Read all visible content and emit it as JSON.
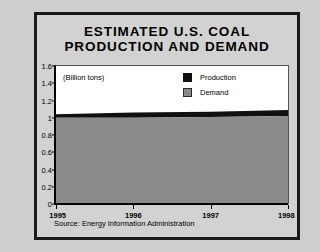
{
  "title": {
    "line1": "ESTIMATED U.S. COAL",
    "line2": "PRODUCTION AND DEMAND"
  },
  "units_note": "(Billion tons)",
  "legend": {
    "items": [
      {
        "label": "Production",
        "color": "#101010",
        "swatch": "production-swatch"
      },
      {
        "label": "Demand",
        "color": "#8a8a8a",
        "swatch": "demand-swatch"
      }
    ]
  },
  "source": "Source: Energy Information Administration",
  "chart_data": {
    "type": "area",
    "title": "ESTIMATED U.S. COAL PRODUCTION AND DEMAND",
    "xlabel": "",
    "ylabel": "",
    "units": "Billion tons",
    "stacked": false,
    "grid": false,
    "legend_position": "top-right",
    "x": [
      1995,
      1996,
      1997,
      1998
    ],
    "xtick_labels": [
      "1995",
      "1996",
      "1997",
      "1998"
    ],
    "xlim": [
      1995,
      1998
    ],
    "ylim": [
      0,
      1.6
    ],
    "ytick_labels": [
      "0",
      "0.2",
      "0.4",
      "0.6",
      "0.8",
      "1",
      "1.2",
      "1.4",
      "1.6"
    ],
    "ytick_values": [
      0,
      0.2,
      0.4,
      0.6,
      0.8,
      1.0,
      1.2,
      1.4,
      1.6
    ],
    "series": [
      {
        "name": "Production",
        "color": "#101010",
        "values": [
          1.04,
          1.06,
          1.07,
          1.09
        ]
      },
      {
        "name": "Demand",
        "color": "#8a8a8a",
        "values": [
          1.0,
          1.0,
          1.01,
          1.02
        ]
      }
    ]
  }
}
